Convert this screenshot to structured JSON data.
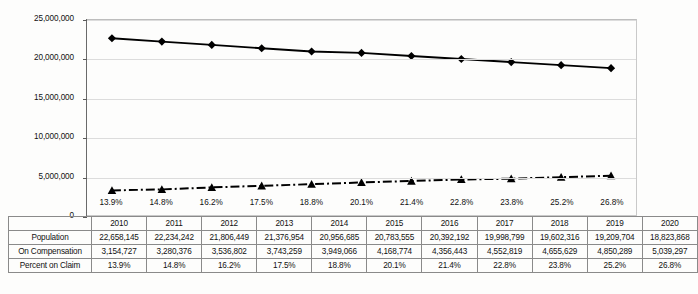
{
  "chart_data": {
    "type": "line",
    "title": "",
    "xlabel": "",
    "ylabel": "",
    "ylim": [
      0,
      25000000
    ],
    "ytick_labels": [
      "0",
      "5,000,000",
      "10,000,000",
      "15,000,000",
      "20,000,000",
      "25,000,000"
    ],
    "ytick_values": [
      0,
      5000000,
      10000000,
      15000000,
      20000000,
      25000000
    ],
    "grid": true,
    "legend": "none",
    "categories": [
      "2010",
      "2011",
      "2012",
      "2013",
      "2014",
      "2015",
      "2016",
      "2017",
      "2018",
      "2019",
      "2020"
    ],
    "series": [
      {
        "name": "Population",
        "marker": "diamond",
        "line_style": "solid",
        "color": "#000000",
        "values": [
          22658145,
          22234242,
          21806449,
          21376954,
          20956685,
          20783555,
          20392192,
          19998799,
          19602316,
          19209704,
          18823868
        ]
      },
      {
        "name": "On Compensation",
        "marker": "triangle",
        "line_style": "dash-dot",
        "color": "#000000",
        "values": [
          3154727,
          3280376,
          3536802,
          3743259,
          3949066,
          4168774,
          4356443,
          4552819,
          4655629,
          4850289,
          5039297
        ]
      }
    ],
    "point_labels": [
      "13.9%",
      "14.8%",
      "16.2%",
      "17.5%",
      "18.8%",
      "20.1%",
      "21.4%",
      "22.8%",
      "23.8%",
      "25.2%",
      "26.8%"
    ]
  },
  "table": {
    "corner_label": "",
    "year_headers": [
      "2010",
      "2011",
      "2012",
      "2013",
      "2014",
      "2015",
      "2016",
      "2017",
      "2018",
      "2019",
      "2020"
    ],
    "rows": [
      {
        "label": "Population",
        "cells": [
          "22,658,145",
          "22,234,242",
          "21,806,449",
          "21,376,954",
          "20,956,685",
          "20,783,555",
          "20,392,192",
          "19,998,799",
          "19,602,316",
          "19,209,704",
          "18,823,868"
        ]
      },
      {
        "label": "On Compensation",
        "cells": [
          "3,154,727",
          "3,280,376",
          "3,536,802",
          "3,743,259",
          "3,949,066",
          "4,168,774",
          "4,356,443",
          "4,552,819",
          "4,655,629",
          "4,850,289",
          "5,039,297"
        ]
      },
      {
        "label": "Percent on Claim",
        "cells": [
          "13.9%",
          "14.8%",
          "16.2%",
          "17.5%",
          "18.8%",
          "20.1%",
          "21.4%",
          "22.8%",
          "23.8%",
          "25.2%",
          "26.8%"
        ]
      }
    ]
  },
  "colors": {
    "series_line": "#000000",
    "gridline": "#dcdcdc",
    "plot_border": "#c9c9c9",
    "table_border": "#8a8a8a",
    "background": "#fdfdfc"
  }
}
